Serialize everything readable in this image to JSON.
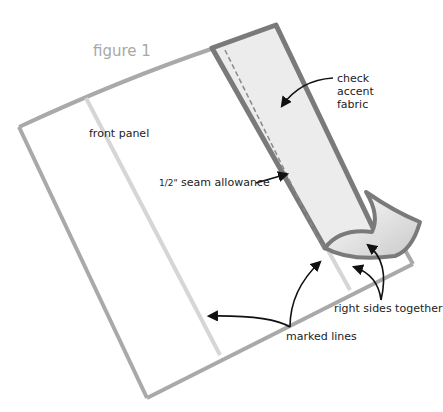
{
  "figure": {
    "title": "figure 1",
    "colors": {
      "outline": "#a9a9a9",
      "marked_line": "#d4d4d4",
      "strip_border": "#7a7a7a",
      "strip_fill": "#ececec",
      "arrow": "#111111"
    }
  },
  "labels": {
    "front_panel": "front panel",
    "check_accent_1": "check",
    "check_accent_2": "accent",
    "check_accent_3": "fabric",
    "seam_fraction": "1/2\"",
    "seam_allowance": " seam allowance",
    "right_sides": "right sides together",
    "marked_lines": "marked lines"
  }
}
